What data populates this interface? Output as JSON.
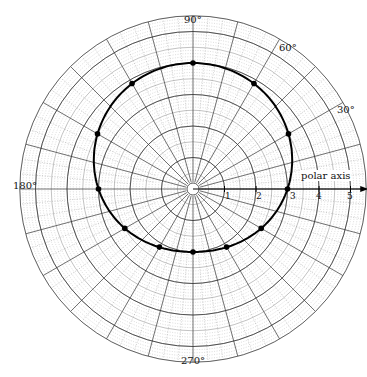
{
  "chart_data": {
    "type": "line",
    "subtype": "polar",
    "title": "",
    "equation_hint": "r = 3 + sin(theta)",
    "angle_labels": [
      {
        "text": "90°",
        "angle": 90
      },
      {
        "text": "60°",
        "angle": 60
      },
      {
        "text": "30°",
        "angle": 30
      },
      {
        "text": "180°",
        "angle": 180
      },
      {
        "text": "270°",
        "angle": 270
      }
    ],
    "axis_label": "polar axis",
    "radial_ticks": [
      "1",
      "2",
      "3",
      "4",
      "5"
    ],
    "rlim": [
      0,
      5.5
    ],
    "grid": true,
    "series": [
      {
        "name": "curve",
        "theta_deg": [
          0,
          30,
          60,
          90,
          120,
          150,
          180,
          210,
          240,
          270,
          300,
          330
        ],
        "r": [
          3,
          3.5,
          3.87,
          4,
          3.87,
          3.5,
          3,
          2.5,
          2.13,
          2,
          2.13,
          2.5
        ]
      }
    ]
  },
  "labels": {
    "deg90": "90°",
    "deg60": "60°",
    "deg30": "30°",
    "deg180": "180°",
    "deg270": "270°",
    "polar_axis": "polar axis",
    "t1": "1",
    "t2": "2",
    "t3": "3",
    "t4": "4",
    "t5": "5"
  }
}
